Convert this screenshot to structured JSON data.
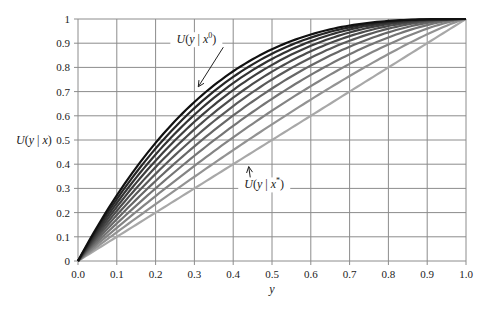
{
  "chart_data": {
    "type": "line",
    "title": "",
    "xlabel": "y",
    "ylabel": "U(y | x)",
    "xlim": [
      0,
      1
    ],
    "ylim": [
      0,
      1
    ],
    "grid": true,
    "legend": "none",
    "x_ticks": [
      "0.0",
      "0.1",
      "0.2",
      "0.3",
      "0.4",
      "0.5",
      "0.6",
      "0.7",
      "0.8",
      "0.9",
      "1.0"
    ],
    "y_ticks": [
      "0",
      "0.1",
      "0.2",
      "0.3",
      "0.4",
      "0.5",
      "0.6",
      "0.7",
      "0.8",
      "0.9",
      "1"
    ],
    "x": [
      0.0,
      0.05,
      0.1,
      0.15,
      0.2,
      0.25,
      0.3,
      0.35,
      0.4,
      0.45,
      0.5,
      0.55,
      0.6,
      0.65,
      0.7,
      0.75,
      0.8,
      0.85,
      0.9,
      0.95,
      1.0
    ],
    "series": [
      {
        "name": "U(y | x^0)",
        "exponent": 3.0,
        "color": "#111111",
        "values": [
          0,
          0.143,
          0.271,
          0.386,
          0.488,
          0.578,
          0.657,
          0.725,
          0.784,
          0.834,
          0.875,
          0.909,
          0.936,
          0.957,
          0.973,
          0.984,
          0.992,
          0.997,
          0.999,
          1.0,
          1.0
        ]
      },
      {
        "name": "curve 2",
        "exponent": 2.8,
        "color": "#262626",
        "values": [
          0,
          0.134,
          0.255,
          0.366,
          0.465,
          0.553,
          0.632,
          0.701,
          0.762,
          0.814,
          0.857,
          0.893,
          0.923,
          0.947,
          0.966,
          0.979,
          0.989,
          0.995,
          0.998,
          1.0,
          1.0
        ]
      },
      {
        "name": "curve 3",
        "exponent": 2.6,
        "color": "#333333",
        "values": [
          0,
          0.125,
          0.24,
          0.345,
          0.44,
          0.527,
          0.605,
          0.674,
          0.735,
          0.789,
          0.835,
          0.874,
          0.907,
          0.935,
          0.956,
          0.973,
          0.985,
          0.993,
          0.997,
          0.999,
          1.0
        ]
      },
      {
        "name": "curve 4",
        "exponent": 2.4,
        "color": "#3f3f3f",
        "values": [
          0,
          0.116,
          0.223,
          0.323,
          0.415,
          0.499,
          0.575,
          0.644,
          0.707,
          0.762,
          0.811,
          0.853,
          0.889,
          0.919,
          0.945,
          0.964,
          0.979,
          0.989,
          0.996,
          0.999,
          1.0
        ]
      },
      {
        "name": "curve 5",
        "exponent": 2.2,
        "color": "#4c4c4c",
        "values": [
          0,
          0.106,
          0.207,
          0.3,
          0.388,
          0.469,
          0.544,
          0.612,
          0.675,
          0.731,
          0.782,
          0.827,
          0.867,
          0.901,
          0.929,
          0.953,
          0.971,
          0.985,
          0.994,
          0.999,
          1.0
        ]
      },
      {
        "name": "curve 6",
        "exponent": 2.0,
        "color": "#5a5a5a",
        "values": [
          0,
          0.098,
          0.19,
          0.278,
          0.36,
          0.438,
          0.51,
          0.578,
          0.64,
          0.698,
          0.75,
          0.798,
          0.84,
          0.878,
          0.91,
          0.938,
          0.96,
          0.978,
          0.99,
          0.998,
          1.0
        ]
      },
      {
        "name": "curve 7",
        "exponent": 1.8,
        "color": "#676767",
        "values": [
          0,
          0.088,
          0.173,
          0.254,
          0.331,
          0.404,
          0.474,
          0.539,
          0.601,
          0.659,
          0.713,
          0.763,
          0.808,
          0.85,
          0.885,
          0.918,
          0.945,
          0.967,
          0.984,
          0.995,
          1.0
        ]
      },
      {
        "name": "curve 8",
        "exponent": 1.6,
        "color": "#757575",
        "values": [
          0,
          0.079,
          0.155,
          0.229,
          0.3,
          0.369,
          0.435,
          0.498,
          0.559,
          0.616,
          0.67,
          0.721,
          0.769,
          0.814,
          0.854,
          0.891,
          0.924,
          0.952,
          0.975,
          0.992,
          1.0
        ]
      },
      {
        "name": "curve 9",
        "exponent": 1.4,
        "color": "#848484",
        "values": [
          0,
          0.069,
          0.137,
          0.203,
          0.268,
          0.331,
          0.393,
          0.453,
          0.511,
          0.567,
          0.621,
          0.673,
          0.723,
          0.77,
          0.815,
          0.856,
          0.895,
          0.93,
          0.96,
          0.985,
          1.0
        ]
      },
      {
        "name": "curve 10",
        "exponent": 1.2,
        "color": "#939393",
        "values": [
          0,
          0.06,
          0.119,
          0.177,
          0.235,
          0.292,
          0.348,
          0.404,
          0.459,
          0.512,
          0.565,
          0.617,
          0.667,
          0.716,
          0.764,
          0.811,
          0.855,
          0.897,
          0.937,
          0.972,
          1.0
        ]
      },
      {
        "name": "U(y | x*)",
        "exponent": 1.0,
        "color": "#a8a8a8",
        "values": [
          0,
          0.05,
          0.1,
          0.15,
          0.2,
          0.25,
          0.3,
          0.35,
          0.4,
          0.45,
          0.5,
          0.55,
          0.6,
          0.65,
          0.7,
          0.75,
          0.8,
          0.85,
          0.9,
          0.95,
          1.0
        ]
      }
    ],
    "annotations": [
      {
        "text_main": "U(y | x",
        "sup": "0",
        "close": ")",
        "points_to": "top curve",
        "label_x": 0.305,
        "label_y": 0.9,
        "arrow_to_x": 0.31,
        "arrow_to_y": 0.72
      },
      {
        "text_main": "U(y | x",
        "sup": "*",
        "close": ")",
        "points_to": "bottom curve",
        "label_x": 0.48,
        "label_y": 0.3,
        "arrow_to_x": 0.44,
        "arrow_to_y": 0.39
      }
    ]
  }
}
